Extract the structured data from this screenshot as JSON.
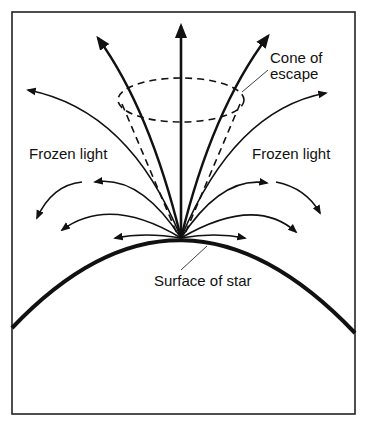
{
  "diagram": {
    "labels": {
      "cone_line1": "Cone of",
      "cone_line2": "escape",
      "frozen_left": "Frozen light",
      "frozen_right": "Frozen light",
      "surface": "Surface of star"
    },
    "colors": {
      "ink": "#111111",
      "background": "#ffffff"
    }
  }
}
